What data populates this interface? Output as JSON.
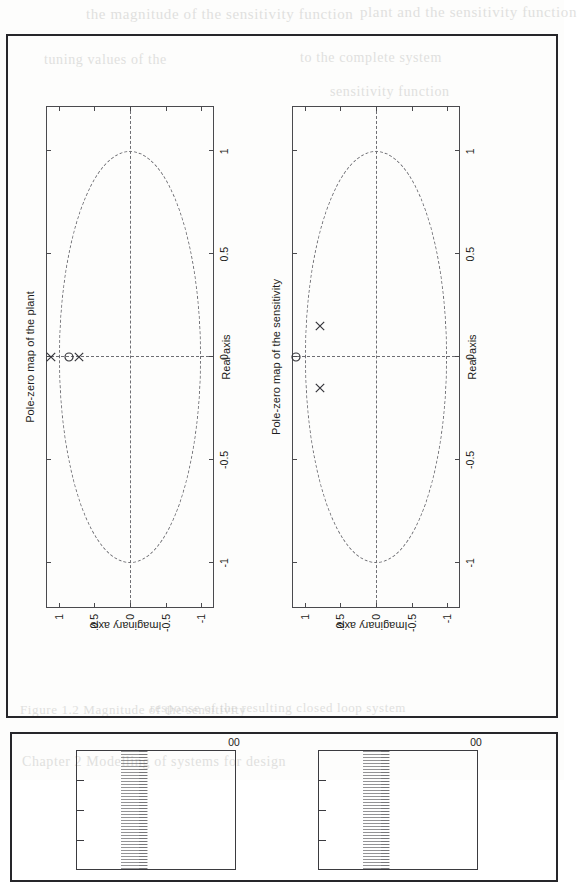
{
  "page": {
    "background_color": "#fdfdfc",
    "ink_color": "#26262a",
    "rotation_note": "page content printed rotated 90 degrees counter-clockwise"
  },
  "ghost_text": [
    {
      "text": "the magnitude of the sensitivity function",
      "x": 86,
      "y": 6,
      "size": 15
    },
    {
      "text": "plant and the sensitivity function",
      "x": 360,
      "y": 4,
      "size": 15
    },
    {
      "text": "tuning  values  of  the",
      "x": 44,
      "y": 52,
      "size": 14
    },
    {
      "text": "to  the  complete  system",
      "x": 300,
      "y": 50,
      "size": 14
    },
    {
      "text": "sensitivity  function",
      "x": 330,
      "y": 84,
      "size": 14
    },
    {
      "text": "Figure 1.2  Magnitude of the sensitivity",
      "x": 20,
      "y": 702,
      "size": 13
    },
    {
      "text": "response of the resulting closed loop system",
      "x": 150,
      "y": 700,
      "size": 13
    },
    {
      "text": "Chapter 2  Modelling of  systems  for  design",
      "x": 22,
      "y": 754,
      "size": 14
    }
  ],
  "figures": {
    "upper": {
      "name": "pole-zero-maps-figure",
      "plots": [
        {
          "id": "plant",
          "title": "Pole-zero map of the plant",
          "xlabel": "Real axis",
          "ylabel": "Imaginary axis",
          "xticks": [
            "-1",
            "-0.5",
            "0",
            "0.5",
            "1"
          ],
          "xtickvals": [
            -1,
            -0.5,
            0,
            0.5,
            1
          ],
          "yticks": [
            "-1",
            "-0.5",
            "0",
            "0.5",
            "1"
          ],
          "ytickvals": [
            -1,
            -0.5,
            0,
            0.5,
            1
          ],
          "xlim": [
            -1.22,
            1.22
          ],
          "ylim": [
            -1.18,
            1.18
          ],
          "unit_circle": true,
          "markers": [
            {
              "type": "pole",
              "symbol": "x",
              "re": 0.0,
              "im": 1.11
            },
            {
              "type": "zero",
              "symbol": "o",
              "re": 0.0,
              "im": 0.86
            },
            {
              "type": "pole",
              "symbol": "x",
              "re": 0.0,
              "im": 0.72
            }
          ]
        },
        {
          "id": "sensitivity",
          "title": "Pole-zero map of the sensitivity",
          "xlabel": "Real axis",
          "ylabel": "Imaginary axis",
          "xticks": [
            "-1",
            "-0.5",
            "0",
            "0.5",
            "1"
          ],
          "xtickvals": [
            -1,
            -0.5,
            0,
            0.5,
            1
          ],
          "yticks": [
            "-1",
            "-0.5",
            "0",
            "0.5",
            "1"
          ],
          "ytickvals": [
            -1,
            -0.5,
            0,
            0.5,
            1
          ],
          "xlim": [
            -1.22,
            1.22
          ],
          "ylim": [
            -1.18,
            1.18
          ],
          "unit_circle": true,
          "markers": [
            {
              "type": "zero",
              "symbol": "o",
              "re": 0.0,
              "im": 1.12
            },
            {
              "type": "pole",
              "symbol": "x",
              "re": 0.15,
              "im": 0.79
            },
            {
              "type": "pole",
              "symbol": "x",
              "re": -0.15,
              "im": 0.79
            }
          ]
        }
      ]
    },
    "lower": {
      "name": "spectra-figure-cropped",
      "cropped": true,
      "plots": [
        {
          "id": "spectrum-left",
          "edge_tick_label": "00"
        },
        {
          "id": "spectrum-right",
          "edge_tick_label": "00"
        }
      ]
    }
  },
  "chart_data": [
    {
      "type": "scatter",
      "title": "Pole-zero map of the plant",
      "xlabel": "Real axis",
      "ylabel": "Imaginary axis",
      "xlim": [
        -1.22,
        1.22
      ],
      "ylim": [
        -1.18,
        1.18
      ],
      "xticks": [
        -1,
        -0.5,
        0,
        0.5,
        1
      ],
      "yticks": [
        -1,
        -0.5,
        0,
        0.5,
        1
      ],
      "grid": "dashed cross at x=0 and y=0, dashed unit circle",
      "legend": "none",
      "series": [
        {
          "name": "poles",
          "marker": "x",
          "x": [
            0.0,
            0.0
          ],
          "y": [
            1.11,
            0.72
          ]
        },
        {
          "name": "zeros",
          "marker": "o",
          "x": [
            0.0
          ],
          "y": [
            0.86
          ]
        }
      ]
    },
    {
      "type": "scatter",
      "title": "Pole-zero map of the sensitivity",
      "xlabel": "Real axis",
      "ylabel": "Imaginary axis",
      "xlim": [
        -1.22,
        1.22
      ],
      "ylim": [
        -1.18,
        1.18
      ],
      "xticks": [
        -1,
        -0.5,
        0,
        0.5,
        1
      ],
      "yticks": [
        -1,
        -0.5,
        0,
        0.5,
        1
      ],
      "grid": "dashed cross at x=0 and y=0, dashed unit circle",
      "legend": "none",
      "series": [
        {
          "name": "poles",
          "marker": "x",
          "x": [
            0.15,
            -0.15
          ],
          "y": [
            0.79,
            0.79
          ]
        },
        {
          "name": "zeros",
          "marker": "o",
          "x": [
            0.0
          ],
          "y": [
            1.12
          ]
        }
      ]
    }
  ]
}
